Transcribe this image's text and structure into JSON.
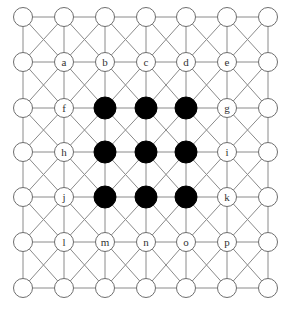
{
  "diagram": {
    "type": "grid-graph",
    "rows": 7,
    "cols": 7,
    "col_x": [
      23,
      64,
      105,
      146,
      186,
      227,
      268
    ],
    "row_y": [
      17,
      62,
      108,
      152,
      197,
      242,
      288
    ],
    "node_radius": 9.5,
    "black_node_radius": 11,
    "connections": [
      "horizontal",
      "vertical",
      "diagonal-both"
    ],
    "colors": {
      "edge": "#8a8a8a",
      "node_stroke": "#6e6e6e",
      "node_fill": "#ffffff",
      "black_fill": "#000000",
      "label": "#333333"
    },
    "black_nodes": [
      [
        2,
        2
      ],
      [
        2,
        3
      ],
      [
        2,
        4
      ],
      [
        3,
        2
      ],
      [
        3,
        3
      ],
      [
        3,
        4
      ],
      [
        4,
        2
      ],
      [
        4,
        3
      ],
      [
        4,
        4
      ]
    ],
    "labeled_nodes": [
      {
        "row": 1,
        "col": 1,
        "label": "a"
      },
      {
        "row": 1,
        "col": 2,
        "label": "b"
      },
      {
        "row": 1,
        "col": 3,
        "label": "c"
      },
      {
        "row": 1,
        "col": 4,
        "label": "d"
      },
      {
        "row": 1,
        "col": 5,
        "label": "e"
      },
      {
        "row": 2,
        "col": 1,
        "label": "f"
      },
      {
        "row": 2,
        "col": 5,
        "label": "g"
      },
      {
        "row": 3,
        "col": 1,
        "label": "h"
      },
      {
        "row": 3,
        "col": 5,
        "label": "i"
      },
      {
        "row": 4,
        "col": 1,
        "label": "j"
      },
      {
        "row": 4,
        "col": 5,
        "label": "k"
      },
      {
        "row": 5,
        "col": 1,
        "label": "l"
      },
      {
        "row": 5,
        "col": 2,
        "label": "m"
      },
      {
        "row": 5,
        "col": 3,
        "label": "n"
      },
      {
        "row": 5,
        "col": 4,
        "label": "o"
      },
      {
        "row": 5,
        "col": 5,
        "label": "p"
      }
    ]
  }
}
